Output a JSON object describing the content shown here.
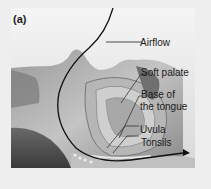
{
  "figure": {
    "panel_label": "(a)",
    "labels": [
      {
        "id": "airflow",
        "text": "Airflow"
      },
      {
        "id": "soft-palate",
        "text": "Soft palate"
      },
      {
        "id": "base-of-tongue-line1",
        "text": "Base of"
      },
      {
        "id": "base-of-tongue-line2",
        "text": "the tongue"
      },
      {
        "id": "uvula",
        "text": "Uvula"
      },
      {
        "id": "tonsils",
        "text": "Tonsils"
      }
    ]
  }
}
